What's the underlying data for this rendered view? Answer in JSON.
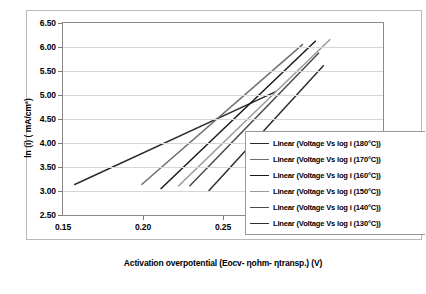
{
  "chart_data": {
    "type": "line",
    "title": "",
    "xlabel": "Activation overpotential (Eocv- ηohm- ηtransp.) (V)",
    "ylabel": "ln (i) ( mA/cm²)",
    "xlim": [
      0.15,
      0.35
    ],
    "ylim": [
      2.5,
      6.5
    ],
    "xticks": [
      "0.15",
      "0.20",
      "0.25",
      "0.30",
      "0.35"
    ],
    "xtick_values": [
      0.15,
      0.2,
      0.25,
      0.3,
      0.35
    ],
    "yticks": [
      "2.50",
      "3.00",
      "3.50",
      "4.00",
      "4.50",
      "5.00",
      "5.50",
      "6.00",
      "6.50"
    ],
    "ytick_values": [
      2.5,
      3.0,
      3.5,
      4.0,
      4.5,
      5.0,
      5.5,
      6.0,
      6.5
    ],
    "grid": "horizontal",
    "legend_position": "lower-right",
    "series": [
      {
        "name": "Linear (Voltage Vs log i (180°C))",
        "color": "#2b2b2b",
        "x": [
          0.157,
          0.283
        ],
        "y": [
          3.13,
          5.07
        ]
      },
      {
        "name": "Linear (Voltage Vs log i (170°C))",
        "color": "#6e6e6e",
        "x": [
          0.199,
          0.3
        ],
        "y": [
          3.13,
          6.06
        ]
      },
      {
        "name": "Linear (Voltage Vs log i (160°C))",
        "color": "#1a1a1a",
        "x": [
          0.211,
          0.308
        ],
        "y": [
          3.04,
          6.13
        ]
      },
      {
        "name": "Linear (Voltage Vs log i (150°C))",
        "color": "#9a9a9a",
        "x": [
          0.222,
          0.317
        ],
        "y": [
          3.1,
          6.16
        ]
      },
      {
        "name": "Linear (Voltage Vs log i (140°C))",
        "color": "#4a4a4a",
        "x": [
          0.229,
          0.31
        ],
        "y": [
          3.1,
          5.88
        ]
      },
      {
        "name": "Linear (Voltage Vs log i (130°C))",
        "color": "#2f2f2f",
        "x": [
          0.241,
          0.313
        ],
        "y": [
          3.0,
          5.62
        ]
      }
    ]
  },
  "caption": ""
}
